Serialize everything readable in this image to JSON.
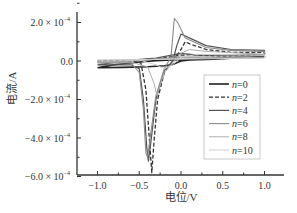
{
  "chart_data": {
    "type": "line",
    "title": "",
    "xlabel": "电位/V",
    "ylabel": "电流/A",
    "xlim": [
      -1.25,
      1.2
    ],
    "ylim": [
      -0.0006,
      0.00025
    ],
    "x_ticks": [
      -1.0,
      -0.5,
      0.0,
      0.5,
      1.0
    ],
    "x_tick_labels": [
      "−1.0",
      "−0.5",
      "0.0",
      "0.5",
      "1.0"
    ],
    "y_ticks": [
      0.0002,
      0.0,
      -0.0002,
      -0.0004,
      -0.0006
    ],
    "y_tick_labels": [
      {
        "mant": "2.0 × 10",
        "exp": "−4"
      },
      {
        "mant": "0.0",
        "exp": ""
      },
      {
        "mant": "−2.0 × 10",
        "exp": "−4"
      },
      {
        "mant": "−4.0 × 10",
        "exp": "−4"
      },
      {
        "mant": "−6.0 × 10",
        "exp": "−4"
      }
    ],
    "grid": false,
    "legend_position": "lower right (inside)",
    "units_note": "current values in units of 1e-4 A",
    "series": [
      {
        "name": "n=0",
        "color": "#222222",
        "dash": "",
        "width": 1.6,
        "points": [
          [
            -1.0,
            -0.35
          ],
          [
            -0.7,
            -0.33
          ],
          [
            -0.4,
            -0.3
          ],
          [
            -0.2,
            -0.25
          ],
          [
            -0.1,
            -0.18
          ],
          [
            0.0,
            0.0
          ],
          [
            0.1,
            0.05
          ],
          [
            0.4,
            0.1
          ],
          [
            1.0,
            0.25
          ],
          [
            1.0,
            0.2
          ],
          [
            0.5,
            0.15
          ],
          [
            0.2,
            0.08
          ],
          [
            0.0,
            0.05
          ],
          [
            -0.1,
            0.05
          ],
          [
            -0.3,
            0.02
          ],
          [
            -0.5,
            -0.05
          ],
          [
            -0.8,
            -0.2
          ],
          [
            -1.0,
            -0.35
          ]
        ]
      },
      {
        "name": "n=2",
        "color": "#333333",
        "dash": "4,2",
        "width": 1.3,
        "points": [
          [
            -1.0,
            0.0
          ],
          [
            -0.6,
            0.0
          ],
          [
            -0.48,
            -0.1
          ],
          [
            -0.42,
            -1.5
          ],
          [
            -0.38,
            -4.0
          ],
          [
            -0.35,
            -5.8
          ],
          [
            -0.32,
            -4.0
          ],
          [
            -0.28,
            -2.0
          ],
          [
            -0.2,
            -0.6
          ],
          [
            -0.1,
            0.0
          ],
          [
            0.0,
            0.6
          ],
          [
            0.05,
            1.0
          ],
          [
            0.1,
            0.9
          ],
          [
            0.3,
            0.6
          ],
          [
            0.6,
            0.45
          ],
          [
            1.0,
            0.45
          ],
          [
            1.0,
            0.3
          ],
          [
            0.5,
            0.25
          ],
          [
            0.2,
            0.3
          ],
          [
            0.0,
            0.3
          ],
          [
            -0.3,
            0.1
          ],
          [
            -0.6,
            0.05
          ],
          [
            -1.0,
            0.0
          ]
        ]
      },
      {
        "name": "n=4",
        "color": "#555555",
        "dash": "",
        "width": 1.2,
        "points": [
          [
            -1.0,
            -0.2
          ],
          [
            -0.6,
            -0.2
          ],
          [
            -0.5,
            -0.4
          ],
          [
            -0.45,
            -2.0
          ],
          [
            -0.41,
            -4.5
          ],
          [
            -0.39,
            -5.2
          ],
          [
            -0.36,
            -4.2
          ],
          [
            -0.3,
            -2.0
          ],
          [
            -0.2,
            -0.5
          ],
          [
            -0.1,
            0.0
          ],
          [
            -0.05,
            0.8
          ],
          [
            0.0,
            1.4
          ],
          [
            0.1,
            1.2
          ],
          [
            0.3,
            0.8
          ],
          [
            0.6,
            0.6
          ],
          [
            1.0,
            0.55
          ],
          [
            1.0,
            0.35
          ],
          [
            0.6,
            0.3
          ],
          [
            0.2,
            0.3
          ],
          [
            0.0,
            0.4
          ],
          [
            -0.3,
            0.15
          ],
          [
            -0.6,
            0.05
          ],
          [
            -1.0,
            -0.2
          ]
        ]
      },
      {
        "name": "n=6",
        "color": "#8a8a8a",
        "dash": "",
        "width": 1.1,
        "points": [
          [
            -1.0,
            -0.1
          ],
          [
            -0.6,
            -0.1
          ],
          [
            -0.5,
            -0.6
          ],
          [
            -0.45,
            -2.5
          ],
          [
            -0.42,
            -4.8
          ],
          [
            -0.4,
            -5.0
          ],
          [
            -0.37,
            -4.0
          ],
          [
            -0.3,
            -1.8
          ],
          [
            -0.2,
            -0.4
          ],
          [
            -0.12,
            0.2
          ],
          [
            -0.08,
            2.2
          ],
          [
            -0.04,
            2.0
          ],
          [
            0.05,
            1.2
          ],
          [
            0.3,
            0.7
          ],
          [
            0.6,
            0.55
          ],
          [
            1.0,
            0.5
          ],
          [
            1.0,
            0.3
          ],
          [
            0.6,
            0.2
          ],
          [
            0.2,
            0.2
          ],
          [
            0.0,
            0.2
          ],
          [
            -0.3,
            0.1
          ],
          [
            -0.6,
            0.0
          ],
          [
            -1.0,
            -0.1
          ]
        ]
      },
      {
        "name": "n=8",
        "color": "#b0b0b0",
        "dash": "",
        "width": 1.0,
        "points": [
          [
            -1.0,
            -0.05
          ],
          [
            -0.6,
            -0.05
          ],
          [
            -0.4,
            -0.3
          ],
          [
            -0.32,
            -1.2
          ],
          [
            -0.29,
            -1.8
          ],
          [
            -0.26,
            -1.4
          ],
          [
            -0.2,
            -0.6
          ],
          [
            -0.1,
            -0.1
          ],
          [
            0.0,
            0.4
          ],
          [
            0.1,
            0.6
          ],
          [
            0.3,
            0.5
          ],
          [
            1.0,
            0.35
          ],
          [
            1.0,
            0.2
          ],
          [
            0.5,
            0.15
          ],
          [
            0.0,
            0.15
          ],
          [
            -0.5,
            0.05
          ],
          [
            -1.0,
            -0.05
          ]
        ]
      },
      {
        "name": "n=10",
        "color": "#d0d0d0",
        "dash": "",
        "width": 1.0,
        "points": [
          [
            -1.0,
            0.05
          ],
          [
            -0.5,
            0.05
          ],
          [
            -0.3,
            -0.2
          ],
          [
            -0.2,
            -0.4
          ],
          [
            -0.1,
            -0.2
          ],
          [
            0.0,
            0.2
          ],
          [
            0.2,
            0.35
          ],
          [
            1.0,
            0.3
          ],
          [
            1.0,
            0.15
          ],
          [
            0.0,
            0.1
          ],
          [
            -1.0,
            0.05
          ]
        ]
      }
    ]
  }
}
